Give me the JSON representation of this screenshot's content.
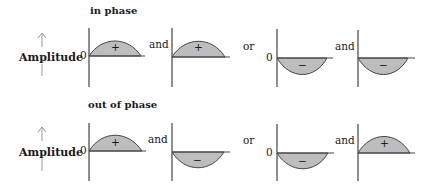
{
  "rows": [
    {
      "heading": "in phase",
      "axis_label": "Amplitude",
      "zero_label": "0",
      "panels": [
        {
          "sign": "+",
          "direction": "up"
        },
        {
          "sign": "+",
          "direction": "up"
        },
        {
          "sign": "−",
          "direction": "down"
        },
        {
          "sign": "−",
          "direction": "down"
        }
      ],
      "connectors": [
        "and",
        "or",
        "and"
      ]
    },
    {
      "heading": "out of phase",
      "axis_label": "Amplitude",
      "zero_label": "0",
      "panels": [
        {
          "sign": "+",
          "direction": "up"
        },
        {
          "sign": "−",
          "direction": "down"
        },
        {
          "sign": "−",
          "direction": "down"
        },
        {
          "sign": "+",
          "direction": "up"
        }
      ],
      "connectors": [
        "and",
        "or",
        "and"
      ]
    }
  ],
  "colors": {
    "fill": "#bdbdbd",
    "stroke": "#444444",
    "arrow": "#999999"
  }
}
